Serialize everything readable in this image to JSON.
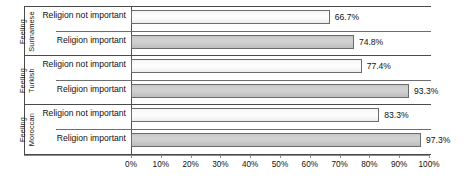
{
  "chart_data": {
    "type": "bar",
    "orientation": "horizontal",
    "title": "",
    "xlabel": "",
    "ylabel": "",
    "xlim": [
      0,
      100
    ],
    "xtick_labels": [
      "0%",
      "10%",
      "20%",
      "30%",
      "40%",
      "50%",
      "60%",
      "70%",
      "80%",
      "90%",
      "100%"
    ],
    "xticks": [
      0,
      10,
      20,
      30,
      40,
      50,
      60,
      70,
      80,
      90,
      100
    ],
    "grid": false,
    "legend": null,
    "value_suffix": "%",
    "groups": [
      {
        "group_label_line1": "Feeling",
        "group_label_line2": "Surinamese",
        "rows": [
          {
            "label": "Religion not important",
            "value": 66.7,
            "value_label": "66.7%",
            "style": "light"
          },
          {
            "label": "Religion important",
            "value": 74.8,
            "value_label": "74.8%",
            "style": "dark"
          }
        ]
      },
      {
        "group_label_line1": "Feeling",
        "group_label_line2": "Turkish",
        "rows": [
          {
            "label": "Religion not important",
            "value": 77.4,
            "value_label": "77.4%",
            "style": "light"
          },
          {
            "label": "Religion important",
            "value": 93.3,
            "value_label": "93.3%",
            "style": "dark"
          }
        ]
      },
      {
        "group_label_line1": "Feeling",
        "group_label_line2": "Moroccan",
        "rows": [
          {
            "label": "Religion not important",
            "value": 83.3,
            "value_label": "83.3%",
            "style": "light"
          },
          {
            "label": "Religion important",
            "value": 97.3,
            "value_label": "97.3%",
            "style": "dark"
          }
        ]
      }
    ],
    "colors": {
      "bar_light_fill": "#fbfbfb",
      "bar_dark_fill": "#cfcfcf",
      "bar_border": "#6b6b6b",
      "axis": "#8a8a8a",
      "text": "#111111",
      "background": "#ffffff"
    }
  }
}
